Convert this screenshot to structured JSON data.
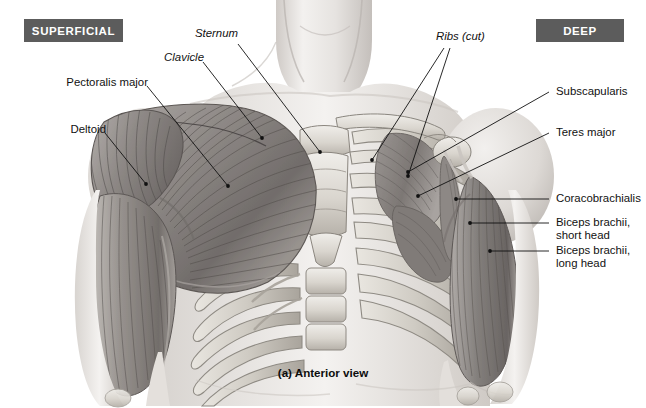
{
  "figure": {
    "title_caption": "(a) Anterior view",
    "view": "Anterior view",
    "rendering": "grayscale pencil/airbrush anatomical illustration",
    "background_color": "#ffffff",
    "line_color": "#1a1a1a"
  },
  "badges": {
    "left": {
      "label": "SUPERFICIAL",
      "bg": "#5c5c5c",
      "fg": "#ffffff"
    },
    "right": {
      "label": "DEEP",
      "bg": "#5c5c5c",
      "fg": "#ffffff"
    }
  },
  "labels": {
    "left": [
      {
        "id": "pectoralis-major",
        "text": "Pectoralis major",
        "style": "muscle"
      },
      {
        "id": "deltoid",
        "text": "Deltoid",
        "style": "muscle"
      }
    ],
    "top": [
      {
        "id": "clavicle",
        "text": "Clavicle",
        "style": "bone"
      },
      {
        "id": "sternum",
        "text": "Sternum",
        "style": "bone"
      },
      {
        "id": "ribs-cut",
        "text": "Ribs (cut)",
        "style": "bone"
      }
    ],
    "right": [
      {
        "id": "subscapularis",
        "text": "Subscapularis",
        "style": "muscle"
      },
      {
        "id": "teres-major",
        "text": "Teres major",
        "style": "muscle"
      },
      {
        "id": "coracobrachialis",
        "text": "Coracobrachialis",
        "style": "muscle"
      },
      {
        "id": "biceps-short-head",
        "text": "Biceps brachii,\nshort head",
        "style": "muscle"
      },
      {
        "id": "biceps-long-head",
        "text": "Biceps brachii,\nlong head",
        "style": "muscle"
      }
    ]
  },
  "palette": {
    "skin_light": "#f2f0ee",
    "skin_mid": "#dedad6",
    "muscle_light": "#b9b5b2",
    "muscle_mid": "#8e8a87",
    "muscle_dark": "#5e5b59",
    "bone_light": "#eceae6",
    "bone_mid": "#cfcbc4",
    "bone_shadow": "#a8a49d"
  }
}
